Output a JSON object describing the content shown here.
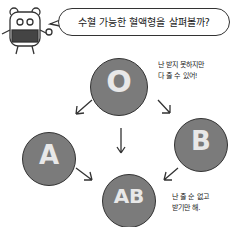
{
  "speech_bubble": {
    "text": "수혈 가능한 혈액형을 살펴볼까?"
  },
  "blood_types": [
    {
      "label": "O"
    },
    {
      "label": "A"
    },
    {
      "label": "B"
    },
    {
      "label": "AB"
    }
  ],
  "notes": {
    "o_line1": "난 받지 못하지만",
    "o_line2": "다 줄 수 있어!",
    "ab_line1": "난 줄 순 없고",
    "ab_line2": "받기만 해."
  },
  "colors": {
    "cell": "#7b7b7b",
    "label": "#e8e8e8",
    "outline": "#333333"
  }
}
